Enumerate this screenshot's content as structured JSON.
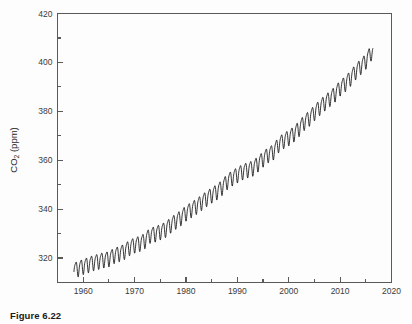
{
  "figure": {
    "caption": "Figure 6.22"
  },
  "chart_data": {
    "type": "line",
    "title": "",
    "xlabel": "",
    "ylabel": "CO₂ (ppm)",
    "ylabel_main": "CO",
    "ylabel_sub": "2",
    "ylabel_units": " (ppm)",
    "xlim": [
      1955,
      2020
    ],
    "ylim": [
      310,
      420
    ],
    "grid": false,
    "legend": null,
    "x_major_ticks": [
      1960,
      1970,
      1980,
      1990,
      2000,
      2010,
      2020
    ],
    "x_major_tick_labels": [
      "1960",
      "1970",
      "1980",
      "1990",
      "2000",
      "2010",
      "2020"
    ],
    "x_minor_ticks": [
      1955,
      1965,
      1975,
      1985,
      1995,
      2005,
      2015
    ],
    "y_major_ticks": [
      320,
      340,
      360,
      380,
      400,
      420
    ],
    "y_major_tick_labels": [
      "320",
      "340",
      "360",
      "380",
      "400",
      "420"
    ],
    "y_minor_ticks": [
      310,
      330,
      350,
      370,
      390,
      410
    ],
    "line_color": "#111111",
    "seasonal_amplitude_ppm": 3.0,
    "series": [
      {
        "name": "Mauna Loa atmospheric CO2 (monthly mean)",
        "x_start": 1958.2,
        "x_end": 2016.4,
        "annual_means": [
          {
            "year": 1958,
            "value": 315.3
          },
          {
            "year": 1959,
            "value": 315.98
          },
          {
            "year": 1960,
            "value": 316.91
          },
          {
            "year": 1961,
            "value": 317.64
          },
          {
            "year": 1962,
            "value": 318.45
          },
          {
            "year": 1963,
            "value": 318.99
          },
          {
            "year": 1964,
            "value": 319.62
          },
          {
            "year": 1965,
            "value": 320.04
          },
          {
            "year": 1966,
            "value": 321.38
          },
          {
            "year": 1967,
            "value": 322.16
          },
          {
            "year": 1968,
            "value": 323.04
          },
          {
            "year": 1969,
            "value": 324.62
          },
          {
            "year": 1970,
            "value": 325.68
          },
          {
            "year": 1971,
            "value": 326.32
          },
          {
            "year": 1972,
            "value": 327.45
          },
          {
            "year": 1973,
            "value": 329.68
          },
          {
            "year": 1974,
            "value": 330.18
          },
          {
            "year": 1975,
            "value": 331.11
          },
          {
            "year": 1976,
            "value": 332.04
          },
          {
            "year": 1977,
            "value": 333.83
          },
          {
            "year": 1978,
            "value": 335.4
          },
          {
            "year": 1979,
            "value": 336.84
          },
          {
            "year": 1980,
            "value": 338.75
          },
          {
            "year": 1981,
            "value": 340.11
          },
          {
            "year": 1982,
            "value": 341.45
          },
          {
            "year": 1983,
            "value": 343.05
          },
          {
            "year": 1984,
            "value": 344.65
          },
          {
            "year": 1985,
            "value": 346.12
          },
          {
            "year": 1986,
            "value": 347.42
          },
          {
            "year": 1987,
            "value": 349.19
          },
          {
            "year": 1988,
            "value": 351.57
          },
          {
            "year": 1989,
            "value": 353.12
          },
          {
            "year": 1990,
            "value": 354.39
          },
          {
            "year": 1991,
            "value": 355.61
          },
          {
            "year": 1992,
            "value": 356.45
          },
          {
            "year": 1993,
            "value": 357.1
          },
          {
            "year": 1994,
            "value": 358.83
          },
          {
            "year": 1995,
            "value": 360.82
          },
          {
            "year": 1996,
            "value": 362.61
          },
          {
            "year": 1997,
            "value": 363.73
          },
          {
            "year": 1998,
            "value": 366.7
          },
          {
            "year": 1999,
            "value": 368.38
          },
          {
            "year": 2000,
            "value": 369.55
          },
          {
            "year": 2001,
            "value": 371.14
          },
          {
            "year": 2002,
            "value": 373.28
          },
          {
            "year": 2003,
            "value": 375.8
          },
          {
            "year": 2004,
            "value": 377.52
          },
          {
            "year": 2005,
            "value": 379.8
          },
          {
            "year": 2006,
            "value": 381.9
          },
          {
            "year": 2007,
            "value": 383.79
          },
          {
            "year": 2008,
            "value": 385.6
          },
          {
            "year": 2009,
            "value": 387.43
          },
          {
            "year": 2010,
            "value": 389.9
          },
          {
            "year": 2011,
            "value": 391.65
          },
          {
            "year": 2012,
            "value": 393.85
          },
          {
            "year": 2013,
            "value": 396.52
          },
          {
            "year": 2014,
            "value": 398.65
          },
          {
            "year": 2015,
            "value": 400.83
          },
          {
            "year": 2016,
            "value": 404.21
          }
        ]
      }
    ]
  }
}
